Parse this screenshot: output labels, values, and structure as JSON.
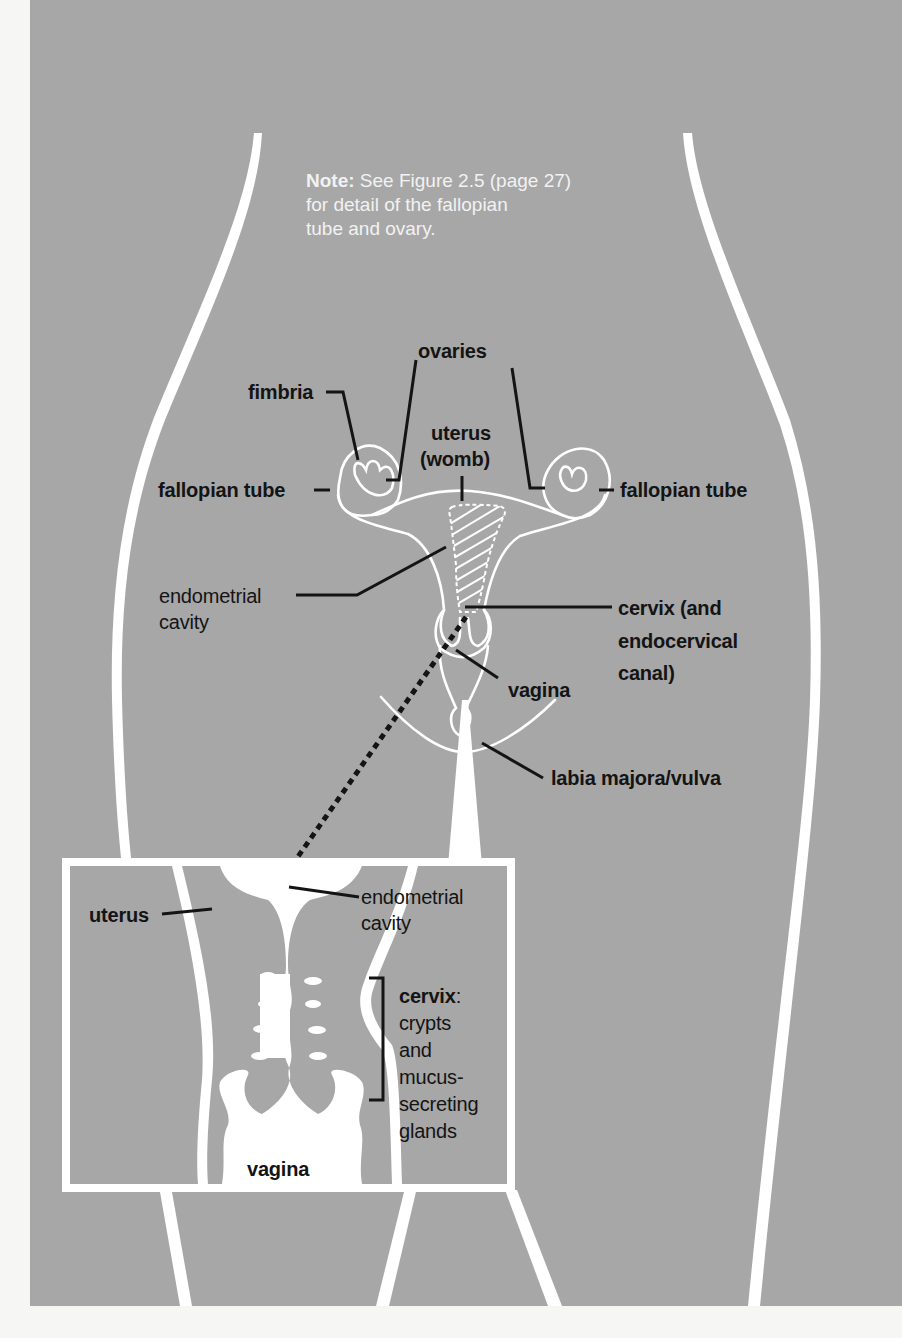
{
  "colors": {
    "page": "#f6f6f4",
    "panel": "#a7a7a7",
    "outline": "#ffffff",
    "leader": "#141414",
    "note_text": "#f2f2f2"
  },
  "note": {
    "prefix": "Note:",
    "line1": " See Figure 2.5 (page 27)",
    "line2": "for detail of the fallopian",
    "line3": "tube and ovary."
  },
  "main_diagram": {
    "labels": {
      "ovaries": "ovaries",
      "fimbria": "fimbria",
      "uterus_line1": "uterus",
      "uterus_line2": "(womb)",
      "fallopian_tube_left": "fallopian tube",
      "fallopian_tube_right": "fallopian tube",
      "endometrial_line1": "endometrial",
      "endometrial_line2": "cavity",
      "cervix_line1": "cervix (and",
      "cervix_line2": "endocervical",
      "cervix_line3": "canal)",
      "vagina": "vagina",
      "labia": "labia majora/vulva"
    }
  },
  "inset": {
    "labels": {
      "uterus": "uterus",
      "endometrial_line1": "endometrial",
      "endometrial_line2": "cavity",
      "cervix_bold": "cervix",
      "cervix_colon": ":",
      "cervix_desc1": "crypts",
      "cervix_desc2": "and",
      "cervix_desc3": "mucus-",
      "cervix_desc4": "secreting",
      "cervix_desc5": "glands",
      "vagina": "vagina"
    }
  }
}
